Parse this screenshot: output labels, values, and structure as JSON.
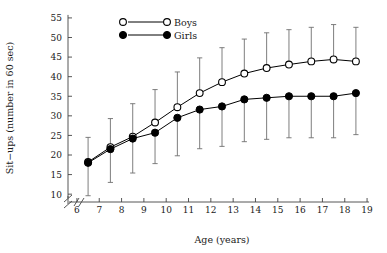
{
  "chart_data": {
    "type": "line",
    "title": "",
    "xlabel": "Age (years)",
    "ylabel": "Sit−ups (number in 60 sec)",
    "xlim": [
      5.6,
      19.4
    ],
    "ylim": [
      8,
      56
    ],
    "xticks": [
      6,
      7,
      8,
      9,
      10,
      11,
      12,
      13,
      14,
      15,
      16,
      17,
      18,
      19
    ],
    "xticklabels": [
      "6",
      "7",
      "8",
      "9",
      "10",
      "11",
      "12",
      "13",
      "14",
      "15",
      "16",
      "17",
      "18",
      "19"
    ],
    "yticks": [
      10,
      15,
      20,
      25,
      30,
      35,
      40,
      45,
      50,
      55
    ],
    "yticklabels": [
      "10",
      "15",
      "20",
      "25",
      "30",
      "35",
      "40",
      "45",
      "50",
      "55"
    ],
    "grid": false,
    "axis_break": true,
    "legend_position": "top-center",
    "x": [
      6.5,
      7.5,
      8.5,
      9.5,
      10.5,
      11.5,
      12.5,
      13.5,
      14.5,
      15.5,
      16.5,
      17.5,
      18.5
    ],
    "series": [
      {
        "name": "Boys",
        "marker": "open-circle",
        "color": "#000000",
        "errorbar_direction": "up",
        "values": [
          18.2,
          22.0,
          24.7,
          28.3,
          32.2,
          35.8,
          38.6,
          40.8,
          42.2,
          43.1,
          43.9,
          44.4,
          43.9
        ],
        "errorbar_upper": [
          24.5,
          29.3,
          33.1,
          36.7,
          41.2,
          44.8,
          47.4,
          49.6,
          51.2,
          52.0,
          52.6,
          53.3,
          52.6
        ]
      },
      {
        "name": "Girls",
        "marker": "filled-circle",
        "color": "#000000",
        "errorbar_direction": "down",
        "values": [
          18.0,
          21.5,
          24.2,
          25.7,
          29.5,
          31.6,
          32.4,
          34.2,
          34.6,
          35.0,
          35.0,
          35.0,
          35.8
        ],
        "errorbar_lower": [
          9.6,
          13.0,
          15.4,
          17.8,
          19.8,
          21.6,
          22.2,
          23.4,
          24.0,
          24.4,
          24.4,
          24.4,
          25.2
        ]
      }
    ]
  },
  "legend": {
    "items": [
      {
        "label": "Boys",
        "marker": "open-circle"
      },
      {
        "label": "Girls",
        "marker": "filled-circle"
      }
    ]
  }
}
